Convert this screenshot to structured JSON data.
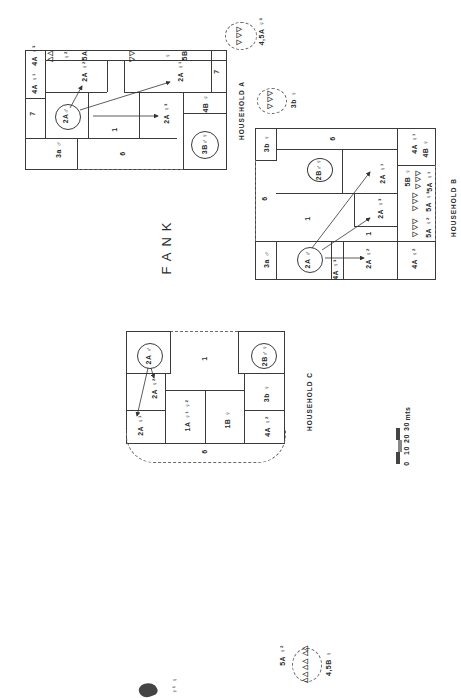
{
  "title": "FANK",
  "scale": {
    "labels": [
      "0",
      "10",
      "20",
      "30",
      "mts"
    ],
    "unit": "mts"
  },
  "households": [
    {
      "id": "A",
      "label": "HOUSEHOLD A",
      "rooms": [
        {
          "code": "7",
          "text": "7"
        },
        {
          "code": "4A1",
          "text": "4A ♀¹"
        },
        {
          "code": "4A3",
          "text": "4A ♀³"
        },
        {
          "code": "44",
          "text": "△△"
        },
        {
          "code": "f2",
          "text": "♀²"
        },
        {
          "code": "5A",
          "text": "5A"
        },
        {
          "code": "2A2",
          "text": "2A ♀²"
        },
        {
          "code": "3a",
          "text": "3a ♂"
        },
        {
          "code": "2Am",
          "text": "2A♂"
        },
        {
          "code": "1",
          "text": "1"
        },
        {
          "code": "6",
          "text": "6"
        },
        {
          "code": "2A3",
          "text": "2A ♀³"
        },
        {
          "code": "tri",
          "text": "▽▽"
        },
        {
          "code": "f",
          "text": "♀"
        },
        {
          "code": "5B",
          "text": "5B"
        },
        {
          "code": "2A1",
          "text": "2A ♀¹"
        },
        {
          "code": "7b",
          "text": "7"
        },
        {
          "code": "4B",
          "text": "4B ♀"
        },
        {
          "code": "3B",
          "text": "3B♂♀"
        }
      ],
      "outer": [
        {
          "text": "4,5A ♀³"
        },
        {
          "text": "3b ♀"
        }
      ]
    },
    {
      "id": "B",
      "label": "HOUSEHOLD B",
      "rooms": [
        {
          "text": "3b ♀"
        },
        {
          "text": "6"
        },
        {
          "text": "4A ♀¹"
        },
        {
          "text": "4B ♀"
        },
        {
          "text": "2B♂♀"
        },
        {
          "text": "2A ♀¹"
        },
        {
          "text": "5B ♀"
        },
        {
          "text": "5A ♀¹"
        },
        {
          "text": "6"
        },
        {
          "text": "1"
        },
        {
          "text": "2A ♀³"
        },
        {
          "text": "5A ♀³"
        },
        {
          "text": "5A ♀²"
        },
        {
          "text": "1"
        },
        {
          "text": "3a ♂"
        },
        {
          "text": "2A ♂"
        },
        {
          "text": "4A ♀³"
        },
        {
          "text": "2A ♀²"
        },
        {
          "text": "4A ♀²"
        }
      ]
    },
    {
      "id": "C",
      "label": "HOUSEHOLD C",
      "rooms": [
        {
          "text": "2A ♂"
        },
        {
          "text": "1"
        },
        {
          "text": "2B♂♀"
        },
        {
          "text": "2A ♀²"
        },
        {
          "text": "3b ♀"
        },
        {
          "text": "2A ♀¹"
        },
        {
          "text": "1A ♀¹ ♀²"
        },
        {
          "text": "1B ♀"
        },
        {
          "text": "4A ♀²"
        },
        {
          "text": "6"
        }
      ],
      "outer": [
        {
          "text": "5A ♀²"
        },
        {
          "text": "4,5B ♀"
        },
        {
          "text": "♀¹ ♀"
        }
      ]
    }
  ],
  "labels": {
    "A": {
      "r7": "7",
      "r4a1": "4A ♀¹",
      "r4a3": "4A ♀³",
      "rtri1": "△△",
      "rf2": "♀²",
      "r5a": "5A",
      "r2a2": "2A ♀²",
      "r3a": "3a ♂",
      "r2am": "2A♂",
      "r1": "1",
      "r6": "6",
      "r2a3": "2A ♀³",
      "rtri2": "▽▽",
      "rf": "♀",
      "r5b": "5B",
      "r2a1": "2A ♀¹",
      "r7b": "7",
      "r4b": "4B ♀",
      "r3b": "3B♂♀",
      "o45a": "4,5A ♀³",
      "o3b": "3b ♀",
      "otri1": "▽ ▽▽",
      "otri2": "▽ ▽▽"
    },
    "B": {
      "r3b": "3b ♀",
      "r6top": "6",
      "r4a1": "4A ♀¹",
      "r4b": "4B ♀",
      "r2b": "2B♂♀",
      "r2a1": "2A ♀¹",
      "r5b": "5B ♀",
      "rtri1": "▽ ▽▽",
      "r5a1": "5A ♀¹",
      "r6left": "6",
      "r1": "1",
      "r2a3": "2A ♀³",
      "rtri2": "▽ ▽▽",
      "r5a3": "5A ♀³",
      "rtri3": "▽ ▽▽",
      "r5a2": "5A ♀²",
      "r1b": "1",
      "r3a": "3a ♂",
      "r2am": "2A ♂",
      "r4a3": "4A ♀³",
      "r2a2": "2A ♀²",
      "r4a2": "4A ♀²"
    },
    "C": {
      "r2am": "2A ♂",
      "r1": "1",
      "r2b": "2B♂♀",
      "r2a2": "2A ♀²",
      "r3b": "3b ♀",
      "r2a1": "2A ♀¹",
      "r1a": "1A ♀¹ ♀²",
      "r1b": "1B ♀",
      "r4a2": "4A ♀²",
      "r6": "6",
      "o5a": "5A ♀²",
      "o45b": "4,5B ♀",
      "ofem": "♀¹ ♀",
      "otri": "△△ △△ △△"
    }
  }
}
